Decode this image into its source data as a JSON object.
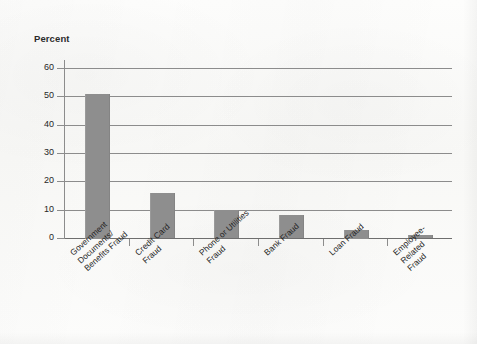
{
  "chart_data": {
    "type": "bar",
    "title": "",
    "ylabel": "Percent",
    "xlabel": "",
    "categories": [
      "Government\nDocuments/\nBenefits Fraud",
      "Credit Card\nFraud",
      "Phone or Utilities\nFraud",
      "Bank Fraud",
      "Loan Fraud",
      "Employee-\nRelated\nFraud"
    ],
    "values": [
      51,
      16,
      10,
      8,
      3,
      1
    ],
    "ylim": [
      0,
      60
    ],
    "yticks": [
      0,
      10,
      20,
      30,
      40,
      50,
      60
    ],
    "ytick_labels": [
      "0",
      "10",
      "20",
      "30",
      "40",
      "50",
      "60"
    ],
    "grid": true,
    "legend": "none",
    "bar_color": "#8e8e8e",
    "axis_color": "#8c8c8c",
    "text_color": "#242424",
    "background_color": "#fbfbfa"
  },
  "axis": {
    "y_title": "Percent"
  }
}
